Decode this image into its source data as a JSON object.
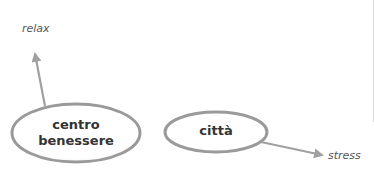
{
  "diagram": {
    "nodes": [
      {
        "id": "centro-benessere",
        "line1": "centro",
        "line2": "benessere"
      },
      {
        "id": "citta",
        "label": "città"
      }
    ],
    "labels": {
      "relax": "relax",
      "stress": "stress"
    },
    "edges": [
      {
        "from": "centro-benessere",
        "to": "relax"
      },
      {
        "from": "citta",
        "to": "stress"
      }
    ],
    "colors": {
      "stroke": "#9a9a9a",
      "arrow": "#a0a0a0",
      "text": "#333333",
      "label": "#555555"
    }
  }
}
